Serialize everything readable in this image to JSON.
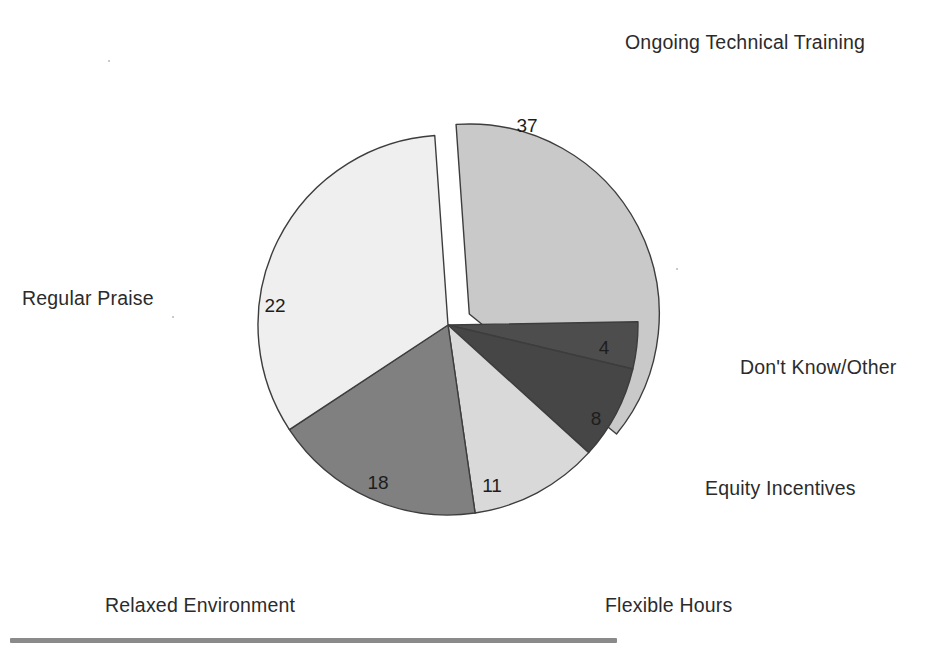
{
  "chart_data": {
    "type": "pie",
    "title": "",
    "subtitle": "",
    "xlabel": "",
    "ylabel": "",
    "grid": false,
    "legend_position": "callout-labels-around-pie",
    "total": 100,
    "units": "percent",
    "categories": [
      "Ongoing Technical Training",
      "Don't Know/Other",
      "Equity Incentives",
      "Flexible Hours",
      "Relaxed Environment",
      "Regular Praise"
    ],
    "values": [
      37,
      4,
      8,
      11,
      18,
      22
    ],
    "value_labels": [
      "37",
      "4",
      "8",
      "11",
      "18",
      "22"
    ],
    "colors": [
      "#c9c9c9",
      "#4d4d4d",
      "#464646",
      "#d9d9d9",
      "#808080",
      "#efefef"
    ],
    "slices": [
      {
        "label": "Ongoing Technical Training",
        "value": 37,
        "value_label": "37",
        "color": "#c9c9c9",
        "exploded": true,
        "start_angle": -94,
        "end_angle": 39.2,
        "label_x": 625,
        "label_y": 33,
        "value_x": 527,
        "value_y": 127
      },
      {
        "label": "Don't Know/Other",
        "value": 4,
        "value_label": "4",
        "color": "#4d4d4d",
        "exploded": false,
        "start_angle": -1,
        "end_angle": 13.4,
        "label_x": 740,
        "label_y": 358,
        "value_x": 604,
        "value_y": 349
      },
      {
        "label": "Equity Incentives",
        "value": 8,
        "value_label": "8",
        "color": "#464646",
        "exploded": false,
        "start_angle": 13.4,
        "end_angle": 42.2,
        "label_x": 705,
        "label_y": 479,
        "value_x": 596,
        "value_y": 420
      },
      {
        "label": "Flexible Hours",
        "value": 11,
        "value_label": "11",
        "color": "#d9d9d9",
        "exploded": false,
        "start_angle": 42.2,
        "end_angle": 81.8,
        "label_x": 605,
        "label_y": 596,
        "value_x": 492,
        "value_y": 487
      },
      {
        "label": "Relaxed Environment",
        "value": 18,
        "value_label": "18",
        "color": "#808080",
        "exploded": false,
        "start_angle": 81.8,
        "end_angle": 146.6,
        "label_x": 105,
        "label_y": 596,
        "value_x": 378,
        "value_y": 484
      },
      {
        "label": "Regular Praise",
        "value": 22,
        "value_label": "22",
        "color": "#efefef",
        "exploded": false,
        "start_angle": 146.6,
        "end_angle": 266,
        "label_x": 22,
        "label_y": 289,
        "value_x": 275,
        "value_y": 307
      }
    ],
    "geometry": {
      "center_x": 448,
      "center_y": 325,
      "radius": 190,
      "explode_offset": 24,
      "stroke": "#3d3d3d",
      "stroke_width": 1.4
    }
  },
  "decoration": {
    "baseline_rule": {
      "x": 10,
      "y": 638,
      "width": 607,
      "color": "#8a8a8a"
    }
  }
}
